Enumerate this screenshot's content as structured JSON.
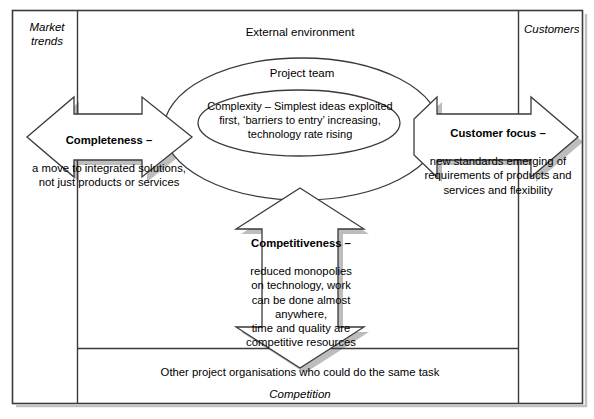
{
  "diagram": {
    "title_outer": "External environment",
    "corner_labels": {
      "top_left": "Market\ntrends",
      "top_right": "Customers",
      "bottom": "Competition"
    },
    "outer_ellipse_label": "Project team",
    "inner_ellipse_text": "Complexity – Simplest ideas exploited\nfirst, ‘barriers to entry’ increasing,\ntechnology rate rising",
    "bottom_band_text": "Other project organisations who could do the same task",
    "arrows": {
      "left": {
        "title": "Completeness –",
        "body": "a move to integrated solutions,\nnot just products or services"
      },
      "right": {
        "title": "Customer focus –",
        "body": "new standards emerging of\nrequirements of products and\nservices and flexibility"
      },
      "down": {
        "title": "Competitiveness –",
        "body": "reduced monopolies\non technology, work\ncan be done almost\nanywhere,\ntime and quality are\ncompetitive resources"
      }
    },
    "colors": {
      "stroke": "#3a3a3a",
      "shadow": "#b8b8b8",
      "fill": "#ffffff",
      "text": "#000000",
      "background": "#ffffff"
    }
  }
}
